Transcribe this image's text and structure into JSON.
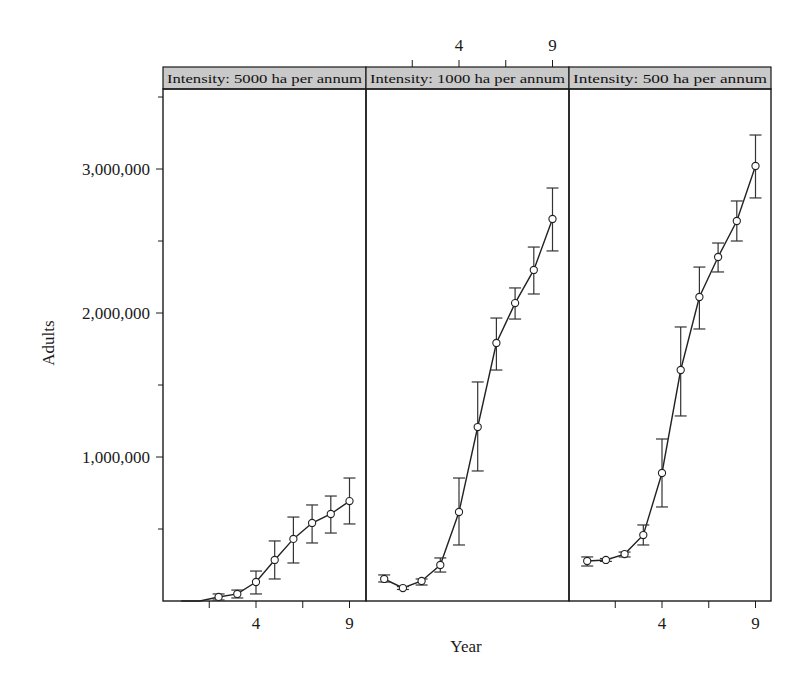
{
  "chart_data": {
    "type": "line",
    "title": "",
    "xlabel": "Year",
    "ylabel": "Adults",
    "ylim": [
      0,
      3550000
    ],
    "y_ticks": [
      {
        "value": 1000000,
        "label": "1,000,000"
      },
      {
        "value": 2000000,
        "label": "2,000,000"
      },
      {
        "value": 3000000,
        "label": "3,000,000"
      }
    ],
    "y_minor_ticks": [
      500000,
      1500000,
      2500000,
      3500000
    ],
    "x_ticks": [
      1.5,
      4,
      6.5,
      9
    ],
    "x_tick_labels": [
      {
        "value": 4,
        "label": "4"
      },
      {
        "value": 9,
        "label": "9"
      }
    ],
    "xlim": [
      -1,
      9.8
    ],
    "grid": false,
    "layout": "three panels side by side with shared y axis; x tick labels alternate bottom (panels 1,3) / top (panel 2)",
    "panels": [
      {
        "strip_label": "Intensity: 5000 ha per annum",
        "x_labels_position": "bottom",
        "x": [
          0,
          1,
          2,
          3,
          4,
          5,
          6,
          7,
          8,
          9
        ],
        "values": [
          0,
          0,
          28000,
          49000,
          132000,
          285000,
          431000,
          542000,
          604000,
          694000
        ],
        "lower": [
          0,
          0,
          7000,
          21000,
          49000,
          153000,
          264000,
          403000,
          472000,
          535000
        ],
        "upper": [
          0,
          0,
          49000,
          76000,
          208000,
          417000,
          583000,
          667000,
          729000,
          854000
        ],
        "markers": [
          false,
          false,
          true,
          true,
          true,
          true,
          true,
          true,
          true,
          true
        ]
      },
      {
        "strip_label": "Intensity: 1000 ha per annum",
        "x_labels_position": "top",
        "x": [
          0,
          1,
          2,
          3,
          4,
          5,
          6,
          7,
          8,
          9
        ],
        "values": [
          153000,
          90000,
          139000,
          250000,
          618000,
          1208000,
          1792000,
          2069000,
          2299000,
          2653000
        ],
        "lower": [
          132000,
          80000,
          111000,
          201000,
          389000,
          903000,
          1604000,
          1958000,
          2132000,
          2431000
        ],
        "upper": [
          181000,
          100000,
          153000,
          299000,
          854000,
          1521000,
          1965000,
          2174000,
          2458000,
          2868000
        ],
        "markers": [
          true,
          true,
          true,
          true,
          true,
          true,
          true,
          true,
          true,
          true
        ]
      },
      {
        "strip_label": "Intensity: 500 ha per annum",
        "x_labels_position": "bottom",
        "x": [
          0,
          1,
          2,
          3,
          4,
          5,
          6,
          7,
          8,
          9
        ],
        "values": [
          278000,
          285000,
          326000,
          458000,
          889000,
          1604000,
          2111000,
          2389000,
          2639000,
          3021000
        ],
        "lower": [
          243000,
          275000,
          306000,
          389000,
          653000,
          1285000,
          1889000,
          2285000,
          2500000,
          2799000
        ],
        "upper": [
          306000,
          295000,
          340000,
          528000,
          1125000,
          1903000,
          2319000,
          2486000,
          2778000,
          3236000
        ],
        "markers": [
          true,
          true,
          true,
          true,
          true,
          true,
          true,
          true,
          true,
          true
        ]
      }
    ]
  },
  "colors": {
    "strip_fill": "#c9c9c9",
    "line": "#222222",
    "marker_fill": "#ffffff",
    "background": "#ffffff"
  }
}
